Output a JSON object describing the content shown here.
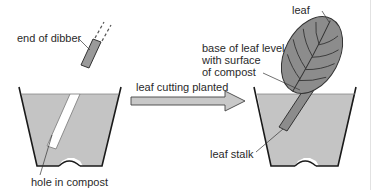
{
  "diagram": {
    "title": "",
    "labels": {
      "dibber": "end of dibber",
      "hole": "hole in compost",
      "arrow": "leaf cutting planted",
      "leaf": "leaf",
      "base_line1": "base of leaf level",
      "base_line2": "with surface",
      "base_line3": "of compost",
      "stalk": "leaf stalk"
    },
    "colors": {
      "compost": "#c4c4c4",
      "leaf": "#8c8c8c",
      "dibber": "#9a9a9a",
      "outline": "#1a1a1a",
      "arrow_fill": "#c8c8c8",
      "text": "#2a2a2a"
    }
  }
}
